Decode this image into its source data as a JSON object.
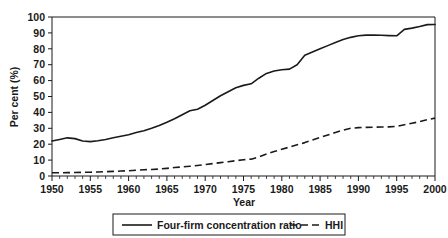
{
  "chart_data": {
    "type": "line",
    "title": "",
    "xlabel": "Year",
    "ylabel": "Per cent (%)",
    "xlim": [
      1950,
      2000
    ],
    "ylim": [
      0,
      100
    ],
    "grid": false,
    "legend_position": "bottom-center",
    "x_ticks": [
      1950,
      1955,
      1960,
      1965,
      1970,
      1975,
      1980,
      1985,
      1990,
      1995,
      2000
    ],
    "x_minor_tick_step": 1,
    "y_ticks": [
      0,
      10,
      20,
      30,
      40,
      50,
      60,
      70,
      80,
      90,
      100
    ],
    "x": [
      1950,
      1951,
      1952,
      1953,
      1954,
      1955,
      1956,
      1957,
      1958,
      1959,
      1960,
      1961,
      1962,
      1963,
      1964,
      1965,
      1966,
      1967,
      1968,
      1969,
      1970,
      1971,
      1972,
      1973,
      1974,
      1975,
      1976,
      1977,
      1978,
      1979,
      1980,
      1981,
      1982,
      1983,
      1984,
      1985,
      1986,
      1987,
      1988,
      1989,
      1990,
      1991,
      1992,
      1993,
      1994,
      1995,
      1996,
      1997,
      1998,
      1999,
      2000
    ],
    "series": [
      {
        "name": "Four-firm concentration ratio",
        "style": "solid",
        "color": "#1a1a1a",
        "values": [
          22.0,
          23.0,
          24.0,
          23.5,
          22.0,
          21.6,
          22.2,
          23.0,
          24.0,
          25.0,
          26.0,
          27.3,
          28.5,
          30.0,
          31.8,
          33.8,
          36.0,
          38.5,
          41.0,
          42.0,
          44.5,
          47.5,
          50.5,
          53.0,
          55.5,
          57.0,
          58.0,
          61.5,
          64.5,
          66.0,
          66.8,
          67.2,
          70.0,
          76.0,
          78.0,
          80.0,
          82.0,
          84.0,
          85.8,
          87.2,
          88.2,
          88.6,
          88.6,
          88.5,
          88.3,
          88.2,
          92.2,
          93.0,
          94.0,
          95.2,
          95.3
        ]
      },
      {
        "name": "HHI",
        "style": "dashed",
        "color": "#1a1a1a",
        "values": [
          2.0,
          2.0,
          2.1,
          2.2,
          2.3,
          2.4,
          2.5,
          2.7,
          2.9,
          3.1,
          3.3,
          3.6,
          3.9,
          4.1,
          4.4,
          4.8,
          5.3,
          5.7,
          6.1,
          6.6,
          7.2,
          7.8,
          8.4,
          9.0,
          9.6,
          10.2,
          10.6,
          12.0,
          13.8,
          15.4,
          16.8,
          18.2,
          19.6,
          21.0,
          22.6,
          24.2,
          25.8,
          27.4,
          28.8,
          30.0,
          30.4,
          30.6,
          30.7,
          30.8,
          30.9,
          31.2,
          32.2,
          33.2,
          34.2,
          35.4,
          36.4
        ]
      }
    ],
    "legend_entries": [
      "Four-firm concentration ratio",
      "HHI"
    ]
  }
}
